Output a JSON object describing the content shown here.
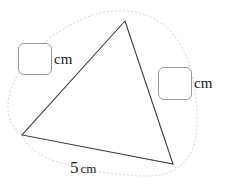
{
  "figure": {
    "type": "triangle",
    "shape_name": "triangle-outline",
    "stroke_color": "#3a3a3a",
    "vertices": {
      "apex": {
        "x": 125,
        "y": 21
      },
      "bottom_left": {
        "x": 22,
        "y": 135
      },
      "bottom_right": {
        "x": 173,
        "y": 164
      }
    },
    "dotted_outline": {
      "name": "dotted-boundary-curve",
      "color": "#cfcfcf",
      "dash": "1,3"
    }
  },
  "labels": {
    "left_side": {
      "box_value": "",
      "unit": "cm"
    },
    "right_side": {
      "box_value": "",
      "unit": "cm"
    },
    "base": {
      "value": "5",
      "unit": "cm"
    }
  }
}
